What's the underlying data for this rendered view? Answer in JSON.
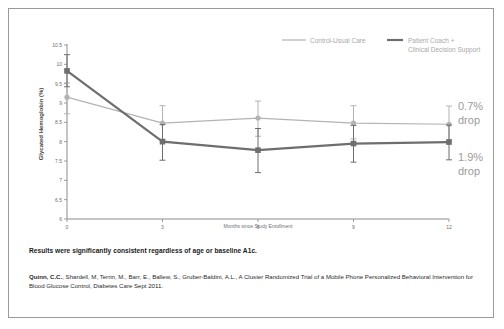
{
  "chart_data": {
    "type": "line",
    "title": "",
    "xlabel": "Months since Study Enrollment",
    "ylabel": "Glycated Hemoglobin (%)",
    "x": [
      0,
      3,
      6,
      9,
      12
    ],
    "xtick_labels": [
      "0",
      "3",
      "6",
      "9",
      "12"
    ],
    "ytick_labels": [
      "6",
      "6.5",
      "7",
      "7.5",
      "8",
      "8.5",
      "9",
      "9.5",
      "10",
      "10.5"
    ],
    "ylim": [
      6,
      10.5
    ],
    "xlim": [
      0,
      12
    ],
    "grid": false,
    "legend_position": "top-right",
    "series": [
      {
        "name": "Control-Usual Care",
        "color": "#b3b3b3",
        "marker": "circle",
        "values": [
          9.15,
          8.48,
          8.61,
          8.48,
          8.45
        ],
        "err_low": [
          8.72,
          8.06,
          8.14,
          8.07,
          8.05
        ],
        "err_high": [
          9.52,
          8.93,
          9.05,
          8.93,
          8.92
        ]
      },
      {
        "name": "Patient Coach + Clinical Decision Support",
        "color": "#6e6e6e",
        "marker": "square",
        "values": [
          9.83,
          8.0,
          7.78,
          7.95,
          7.99
        ],
        "err_low": [
          9.42,
          7.52,
          7.2,
          7.47,
          7.53
        ],
        "err_high": [
          10.25,
          8.44,
          8.34,
          8.42,
          8.43
        ]
      }
    ],
    "annotations": [
      {
        "id": "control-drop",
        "text_line1": "0.7%",
        "text_line2": "drop"
      },
      {
        "id": "intervention-drop",
        "text_line1": "1.9%",
        "text_line2": "drop"
      }
    ]
  },
  "legend": {
    "items": [
      {
        "label": "Control-Usual Care",
        "color": "#b3b3b3"
      },
      {
        "label_line1": "Patient Coach +",
        "label_line2": "Clinical Decision Support",
        "color": "#6e6e6e"
      }
    ]
  },
  "footer": {
    "result_statement": "Results were significantly consistent regardless of age or baseline A1c.",
    "citation_authors": "Quinn, C.C.",
    "citation_rest": ", Shardell, M, Terrin, M., Barr, E., Ballew, S., Gruber-Baldini, A.L., A Cluster Randomized Trial of a Mobile Phone Personalized Behavioral Intervention for Blood Glucose Control, Diabetes Care Sept 2011."
  }
}
